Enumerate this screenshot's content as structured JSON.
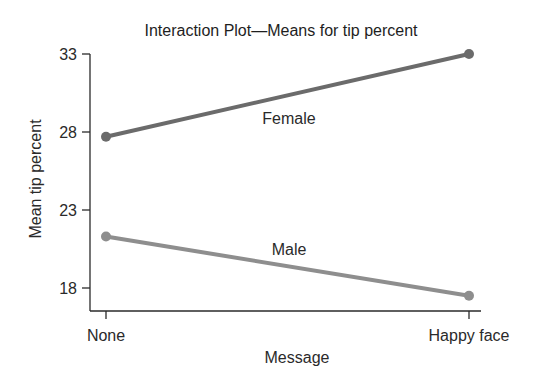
{
  "chart_data": {
    "type": "line",
    "title": "Interaction Plot—Means for tip percent",
    "xlabel": "Message",
    "ylabel": "Mean tip percent",
    "categories": [
      "None",
      "Happy face"
    ],
    "yticks": [
      18,
      23,
      28,
      33
    ],
    "ylim": [
      16.5,
      33
    ],
    "grid": false,
    "legend": "inline labels",
    "series": [
      {
        "name": "Female",
        "values": [
          27.7,
          33.0
        ],
        "color": "#6b6b6b"
      },
      {
        "name": "Male",
        "values": [
          21.3,
          17.5
        ],
        "color": "#8e8e8e"
      }
    ]
  }
}
